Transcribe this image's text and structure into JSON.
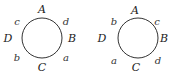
{
  "diagrams": [
    {
      "circle": {
        "cx": 42,
        "cy": 38,
        "r": 20
      },
      "points": [
        {
          "label": "A",
          "x": 42,
          "y": 13
        },
        {
          "label": "B",
          "x": 72,
          "y": 42
        },
        {
          "label": "C",
          "x": 42,
          "y": 71
        },
        {
          "label": "D",
          "x": 8,
          "y": 42
        }
      ],
      "arcs": [
        {
          "label": "c",
          "x": 17,
          "y": 25
        },
        {
          "label": "d",
          "x": 66,
          "y": 25
        },
        {
          "label": "b",
          "x": 17,
          "y": 61
        },
        {
          "label": "a",
          "x": 66,
          "y": 61
        }
      ]
    },
    {
      "circle": {
        "cx": 138,
        "cy": 38,
        "r": 20
      },
      "points": [
        {
          "label": "A",
          "x": 135,
          "y": 14
        },
        {
          "label": "B",
          "x": 164,
          "y": 42
        },
        {
          "label": "C",
          "x": 136,
          "y": 71
        },
        {
          "label": "D",
          "x": 102,
          "y": 42
        }
      ],
      "arcs": [
        {
          "label": "b",
          "x": 114,
          "y": 25
        },
        {
          "label": "c",
          "x": 157,
          "y": 25
        },
        {
          "label": "a",
          "x": 114,
          "y": 64
        },
        {
          "label": "d",
          "x": 158,
          "y": 64
        }
      ]
    }
  ]
}
